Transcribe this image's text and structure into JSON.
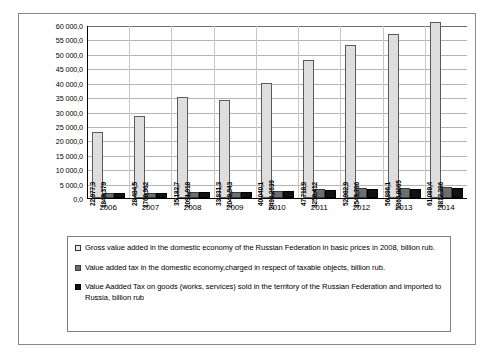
{
  "chart_data": {
    "type": "bar",
    "title": "",
    "subtitle": "",
    "xlabel": "",
    "ylabel": "",
    "categories": [
      "2006",
      "2007",
      "2008",
      "2009",
      "2010",
      "2011",
      "2012",
      "2013",
      "2014"
    ],
    "ylim": [
      0,
      60000
    ],
    "ytick_step": 5000,
    "ytick_labels": [
      "60 000,0",
      "55 000,0",
      "50 000,0",
      "45 000,0",
      "40 000,0",
      "35 000,0",
      "30 000,0",
      "25 000,0",
      "20 000,0",
      "15 000,0",
      "10 000,0",
      "5 000,0",
      "0,0"
    ],
    "grid": true,
    "legend_position": "bottom",
    "series": [
      {
        "name": "Gross value added in the domestic economy of the Russian Federation in basic prices in 2008, billion rub.",
        "color": "#dedede",
        "values": [
          22977.3,
          28484.5,
          35182.7,
          33831.3,
          40040.1,
          47718.9,
          52982.9,
          56896.1,
          61089.4
        ],
        "labels": [
          "22 977,3",
          "28 484,5",
          "35 182,7",
          "33 831,3",
          "40 040,1",
          "47 718,9",
          "52 982,9",
          "56 896,1",
          "61 089,4"
        ]
      },
      {
        "name": "Value added tax in the domestic economy, charged in respect of taxable objects, billion rub.",
        "color": "#6e6e6e",
        "values": [
          1848.379,
          1760.962,
          2091.918,
          2049.943,
          2498.2639,
          3250.412,
          3545.796,
          3365.8065,
          3812.396
        ],
        "labels": [
          "1848,379",
          "1760,962",
          "2091,918",
          "2049,943",
          "2498,2639",
          "3250,412",
          "3545,796",
          "3365,8065",
          "3812,396"
        ]
      },
      {
        "name": "Value Aadded Tax on goods (works, services) sold in the territory of the Russian Federation and imported to Russia, billion rub",
        "color": "#111111",
        "values": [
          1840,
          1760,
          2090,
          2040,
          2500,
          2900,
          3100,
          3200,
          3400
        ],
        "labels": [
          "",
          "",
          "",
          "",
          "",
          "",
          "",
          "",
          ""
        ]
      }
    ]
  },
  "legend": {
    "entries": [
      {
        "icon": "legend-swatch-light",
        "label": "Gross value added in the domestic economy of the Russian Federation in basic prices in 2008, billion rub."
      },
      {
        "icon": "legend-swatch-dark",
        "label": "Value added tax in the domestic economy,charged in respect of taxable objects,  billion rub."
      },
      {
        "icon": "legend-swatch-black",
        "label": "Value Aadded Tax on goods (works, services) sold in the territory of the Russian Federation and imported to Russia, billion  rub"
      }
    ]
  }
}
